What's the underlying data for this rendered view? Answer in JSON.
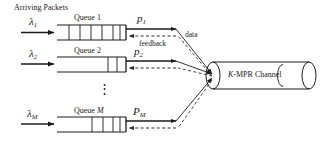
{
  "diagram": {
    "title_label": "Arriving Packets",
    "channel_label": "K-MPR Channel",
    "feedback_label": "feedback",
    "data_label": "data",
    "ellipsis": "⋮",
    "queues": [
      {
        "name": "Queue 1",
        "arrival": "λ",
        "arrival_sub": "1",
        "service": "p",
        "service_sub": "1",
        "cells": 6,
        "filled_from": 0
      },
      {
        "name": "Queue 2",
        "arrival": "λ",
        "arrival_sub": "2",
        "service": "p",
        "service_sub": "2",
        "cells": 2,
        "filled_from": 0
      },
      {
        "name": "Queue M",
        "name_italic_part": "M",
        "arrival": "λ",
        "arrival_sub": "M",
        "service": "P",
        "service_sub": "M",
        "cells": 4,
        "filled_from": 0
      }
    ],
    "colors": {
      "stroke": "#1a1a1a",
      "dashed": "#2b2b2b",
      "background": "#ffffff"
    }
  }
}
